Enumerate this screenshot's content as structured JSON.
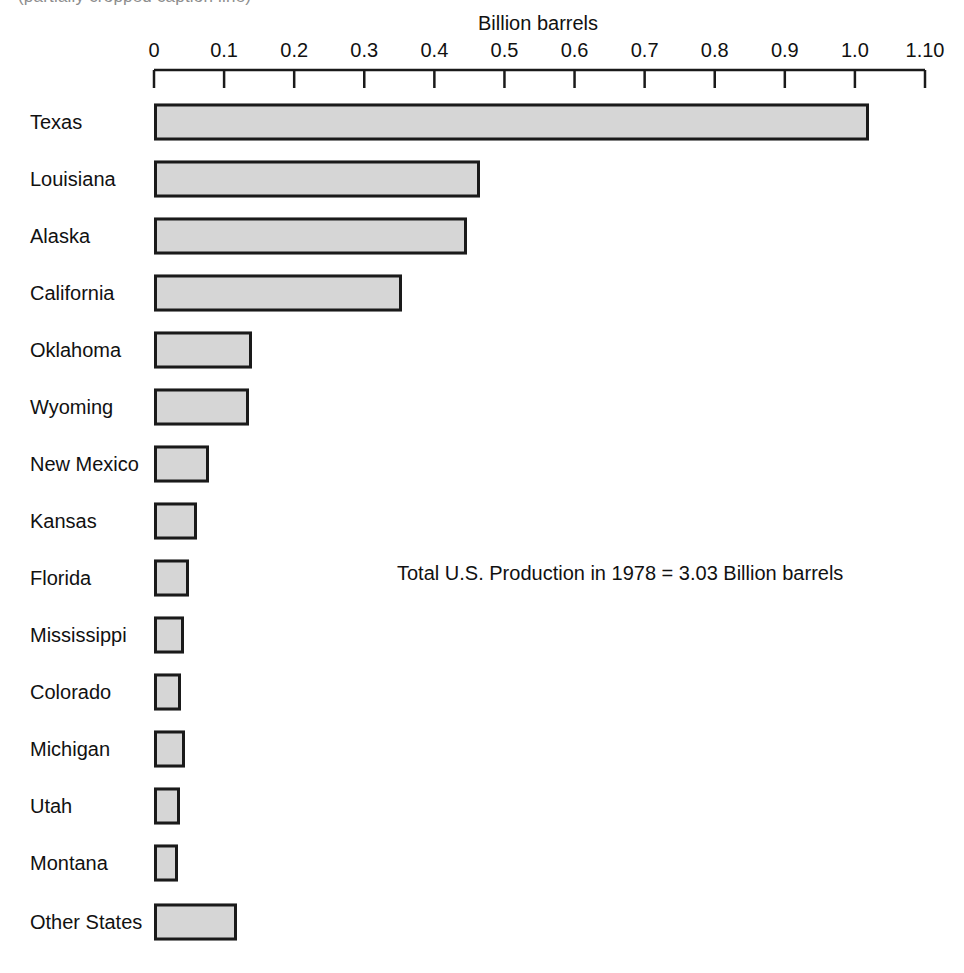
{
  "caption_remnant": "(partially cropped caption line)",
  "annotation": {
    "text": "Total U.S. Production in 1978 = 3.03 Billion barrels",
    "x": 397,
    "y": 561
  },
  "axis": {
    "title": "Billion barrels",
    "tick_labels": [
      "0",
      "0.1",
      "0.2",
      "0.3",
      "0.4",
      "0.5",
      "0.6",
      "0.7",
      "0.8",
      "0.9",
      "1.0",
      "1.10"
    ],
    "tick_values": [
      0,
      0.1,
      0.2,
      0.3,
      0.4,
      0.5,
      0.6,
      0.7,
      0.8,
      0.9,
      1.0,
      1.1
    ],
    "x0_px": 154,
    "x1_px": 925,
    "line_y_px": 70,
    "tick_len_px": 18
  },
  "bars_geometry": {
    "first_row_center_y": 122,
    "row_pitch": 57,
    "bar_height": 37,
    "other_states_center_y": 922
  },
  "colors": {
    "bar_fill": "#d6d6d6",
    "bar_stroke": "#1a1a1a",
    "text": "#111111",
    "background": "#ffffff"
  },
  "chart_data": {
    "type": "bar",
    "orientation": "horizontal",
    "title": "",
    "xlabel": "Billion barrels",
    "ylabel": "",
    "xlim": [
      0,
      1.1
    ],
    "grid": false,
    "legend": null,
    "categories": [
      "Texas",
      "Louisiana",
      "Alaska",
      "California",
      "Oklahoma",
      "Wyoming",
      "New Mexico",
      "Kansas",
      "Florida",
      "Mississippi",
      "Colorado",
      "Michigan",
      "Utah",
      "Montana",
      "Other States"
    ],
    "values": [
      1.02,
      0.465,
      0.446,
      0.354,
      0.14,
      0.136,
      0.079,
      0.061,
      0.05,
      0.043,
      0.038,
      0.044,
      0.037,
      0.034,
      0.118
    ],
    "units": "billion barrels",
    "annotations": [
      "Total U.S. Production in 1978 = 3.03 Billion barrels"
    ]
  }
}
